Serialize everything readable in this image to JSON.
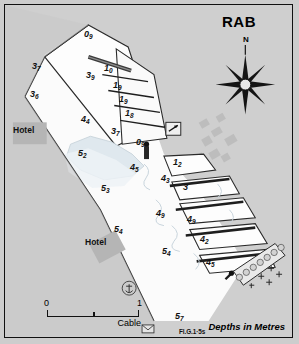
{
  "chart": {
    "title": "RAB",
    "depths_note": "Depths in Metres",
    "north_label": "N",
    "scale": {
      "start": "0",
      "end": "1",
      "unit": "Cable"
    },
    "light": {
      "label": "Fl.G.1·5s"
    },
    "land_labels": [
      {
        "text": "Hotel",
        "x": 12,
        "y": 125
      },
      {
        "text": "Hotel",
        "x": 84,
        "y": 237
      }
    ],
    "soundings": [
      {
        "whole": "0",
        "dec": "9",
        "x": 83,
        "y": 33
      },
      {
        "whole": "3",
        "dec": "7",
        "x": 31,
        "y": 65
      },
      {
        "whole": "3",
        "dec": "9",
        "x": 85,
        "y": 74
      },
      {
        "whole": "1",
        "dec": "0",
        "x": 103,
        "y": 67
      },
      {
        "whole": "3",
        "dec": "6",
        "x": 29,
        "y": 93
      },
      {
        "whole": "1",
        "dec": "9",
        "x": 112,
        "y": 84
      },
      {
        "whole": "1",
        "dec": "9",
        "x": 118,
        "y": 98
      },
      {
        "whole": "1",
        "dec": "8",
        "x": 124,
        "y": 112
      },
      {
        "whole": "4",
        "dec": "4",
        "x": 80,
        "y": 118
      },
      {
        "whole": "3",
        "dec": "7",
        "x": 110,
        "y": 130
      },
      {
        "whole": "0",
        "dec": "9",
        "x": 135,
        "y": 141
      },
      {
        "whole": "5",
        "dec": "2",
        "x": 77,
        "y": 152
      },
      {
        "whole": "1",
        "dec": "2",
        "x": 172,
        "y": 161
      },
      {
        "whole": "4",
        "dec": "5",
        "x": 129,
        "y": 166
      },
      {
        "whole": "4",
        "dec": "3",
        "x": 160,
        "y": 177
      },
      {
        "whole": "3",
        "dec": "",
        "x": 182,
        "y": 186
      },
      {
        "whole": "5",
        "dec": "3",
        "x": 100,
        "y": 187
      },
      {
        "whole": "4",
        "dec": "9",
        "x": 155,
        "y": 212
      },
      {
        "whole": "4",
        "dec": "9",
        "x": 186,
        "y": 218
      },
      {
        "whole": "5",
        "dec": "4",
        "x": 113,
        "y": 228
      },
      {
        "whole": "4",
        "dec": "2",
        "x": 199,
        "y": 238
      },
      {
        "whole": "5",
        "dec": "4",
        "x": 161,
        "y": 250
      },
      {
        "whole": "4",
        "dec": "5",
        "x": 205,
        "y": 261
      },
      {
        "whole": "5",
        "dec": "7",
        "x": 174,
        "y": 315
      }
    ],
    "symbols": [
      {
        "name": "anchorage-symbol",
        "x": 122,
        "y": 284
      },
      {
        "name": "post-office-symbol",
        "x": 143,
        "y": 327
      },
      {
        "name": "view-marker-icon",
        "x": 168,
        "y": 124
      },
      {
        "name": "light-beacon-symbol",
        "x": 144,
        "y": 149
      },
      {
        "name": "compass-rose",
        "x": 246,
        "y": 78
      }
    ]
  }
}
